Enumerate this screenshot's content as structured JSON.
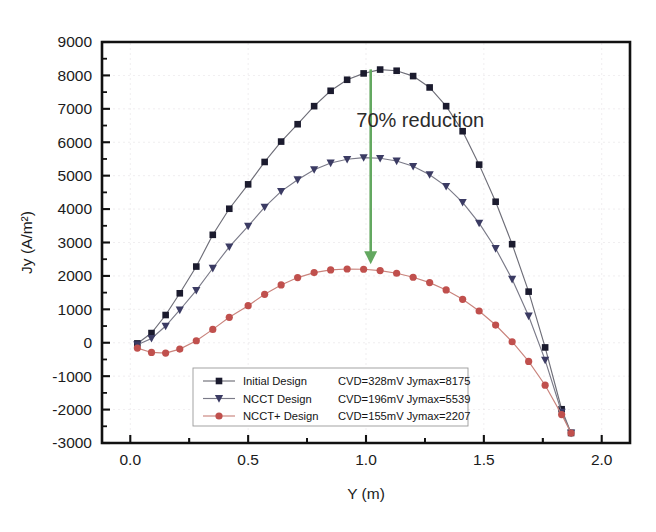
{
  "chart_data": {
    "type": "line",
    "title": "",
    "xlabel": "Y (m)",
    "ylabel": "Jy (A/m²)",
    "xlim": [
      -0.12,
      2.12
    ],
    "ylim": [
      -3000,
      9000
    ],
    "xticks": [
      "0.0",
      "0.5",
      "1.0",
      "1.5",
      "2.0"
    ],
    "xtick_values": [
      0.0,
      0.5,
      1.0,
      1.5,
      2.0
    ],
    "yticks": [
      "-3000",
      "-2000",
      "-1000",
      "0",
      "1000",
      "2000",
      "3000",
      "4000",
      "5000",
      "6000",
      "7000",
      "8000",
      "9000"
    ],
    "ytick_values": [
      -3000,
      -2000,
      -1000,
      0,
      1000,
      2000,
      3000,
      4000,
      5000,
      6000,
      7000,
      8000,
      9000
    ],
    "grid": true,
    "minor_ticks": true,
    "legend_position": "lower-center",
    "annotations": [
      {
        "name": "reduction-annotation",
        "text": "70% reduction",
        "x": 1.23,
        "y": 6450,
        "arrow": {
          "name": "reduction-arrow",
          "color": "#63a860",
          "x": 1.02,
          "y_start": 8180,
          "y_end": 2350
        }
      }
    ],
    "series": [
      {
        "name": "Initial  Design",
        "info": "CVD=328mV Jymax=8175",
        "cvd_mv": 328,
        "jymax": 8175,
        "color": "#1b1b2e",
        "marker": "square",
        "line_color": "#6e6e78",
        "x": [
          0.03,
          0.09,
          0.15,
          0.21,
          0.28,
          0.35,
          0.42,
          0.5,
          0.57,
          0.64,
          0.71,
          0.78,
          0.85,
          0.92,
          0.99,
          1.06,
          1.13,
          1.2,
          1.27,
          1.34,
          1.41,
          1.48,
          1.55,
          1.62,
          1.69,
          1.76,
          1.83,
          1.87
        ],
        "y": [
          -20,
          290,
          830,
          1480,
          2280,
          3230,
          4010,
          4740,
          5410,
          6020,
          6540,
          7080,
          7540,
          7870,
          8060,
          8175,
          8140,
          7980,
          7640,
          7080,
          6330,
          5330,
          4220,
          2950,
          1530,
          -140,
          -1990,
          -2700
        ]
      },
      {
        "name": "NCCT  Design",
        "info": "CVD=196mV Jymax=5539",
        "cvd_mv": 196,
        "jymax": 5539,
        "color": "#3b3b63",
        "marker": "triangle-down",
        "line_color": "#7a7a88",
        "x": [
          0.03,
          0.09,
          0.15,
          0.21,
          0.28,
          0.35,
          0.42,
          0.5,
          0.57,
          0.64,
          0.71,
          0.78,
          0.85,
          0.92,
          0.99,
          1.06,
          1.13,
          1.2,
          1.27,
          1.34,
          1.41,
          1.48,
          1.55,
          1.62,
          1.69,
          1.76,
          1.83,
          1.87
        ],
        "y": [
          -60,
          130,
          500,
          980,
          1570,
          2230,
          2870,
          3490,
          4060,
          4530,
          4880,
          5180,
          5380,
          5490,
          5539,
          5520,
          5440,
          5280,
          5030,
          4680,
          4200,
          3580,
          2820,
          1900,
          800,
          -520,
          -2080,
          -2700
        ]
      },
      {
        "name": "NCCT+  Design",
        "info": "CVD=155mV Jymax=2207",
        "cvd_mv": 155,
        "jymax": 2207,
        "color": "#c0504d",
        "marker": "circle",
        "line_color": "#c9837c",
        "x": [
          0.03,
          0.09,
          0.15,
          0.21,
          0.28,
          0.35,
          0.42,
          0.5,
          0.57,
          0.64,
          0.71,
          0.78,
          0.85,
          0.92,
          0.99,
          1.06,
          1.13,
          1.2,
          1.27,
          1.34,
          1.41,
          1.48,
          1.55,
          1.62,
          1.69,
          1.76,
          1.83,
          1.87
        ],
        "y": [
          -160,
          -290,
          -310,
          -190,
          60,
          400,
          760,
          1110,
          1450,
          1730,
          1950,
          2100,
          2180,
          2207,
          2200,
          2160,
          2080,
          1960,
          1800,
          1580,
          1300,
          950,
          530,
          30,
          -560,
          -1270,
          -2150,
          -2700
        ]
      }
    ]
  },
  "legend": {
    "entries": [
      {
        "label": "Initial  Design",
        "info": "CVD=328mV Jymax=8175"
      },
      {
        "label": "NCCT  Design",
        "info": "CVD=196mV Jymax=5539"
      },
      {
        "label": "NCCT+  Design",
        "info": "CVD=155mV Jymax=2207"
      }
    ]
  },
  "caption": {
    "ghost_text": ""
  }
}
